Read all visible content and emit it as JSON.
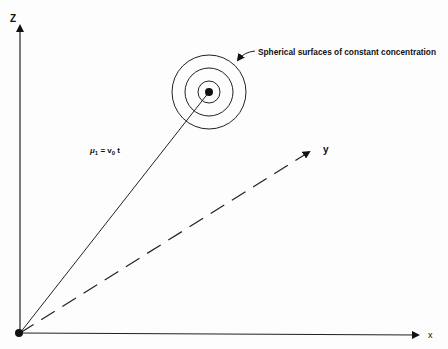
{
  "diagram": {
    "axes": {
      "z_label": "Z",
      "y_label": "y",
      "x_label": "x"
    },
    "annotation": {
      "text": "Spherical surfaces of constant concentration"
    },
    "vector_label": {
      "mu": "μ",
      "mu_sub": "1",
      "equals": " = v",
      "v_sub": "0",
      "t": " t"
    },
    "colors": {
      "ink": "#111111",
      "background": "#fdfdfd"
    }
  }
}
